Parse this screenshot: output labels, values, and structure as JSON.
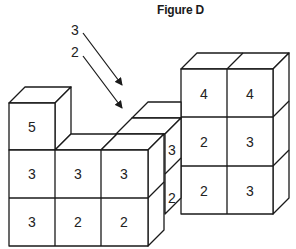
{
  "title": "Figure D",
  "labels": {
    "arrow_top": "3",
    "arrow_bottom": "2"
  },
  "colors": {
    "line": "#1a1a1a",
    "face": "#ffffff",
    "background": "#ffffff"
  },
  "left_block": {
    "top_cube": "5",
    "middle_row": [
      "3",
      "3",
      "3"
    ],
    "bottom_row": [
      "3",
      "2",
      "2"
    ]
  },
  "middle_side": {
    "upper": "3",
    "lower": "2"
  },
  "right_block": {
    "top_row": [
      "4",
      "4"
    ],
    "middle_row": [
      "2",
      "3"
    ],
    "bottom_row": [
      "2",
      "3"
    ]
  }
}
